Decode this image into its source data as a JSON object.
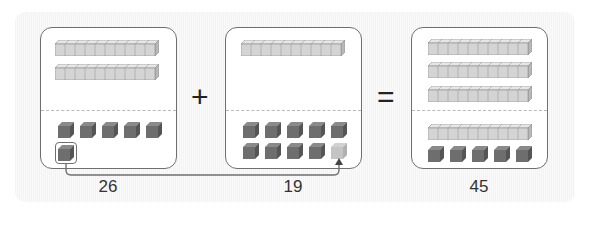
{
  "figure": {
    "type": "base-ten-blocks-addition",
    "operands": [
      {
        "label": "26",
        "tens": 2,
        "ones": 6
      },
      {
        "label": "19",
        "tens": 1,
        "ones": 9,
        "ghost_ones": 1
      }
    ],
    "operator_plus": "+",
    "operator_equals": "=",
    "result": {
      "label": "45",
      "tens": 4,
      "ones": 5
    },
    "annotation": "One unit cube moved from 26 to complete a ten in 19",
    "colors": {
      "rod_fill": "#d4d4d4",
      "rod_edge": "#8a8a8a",
      "unit_fill": "#6e6e6e",
      "unit_edge": "#4a4a4a",
      "box_border": "#6f6f6f",
      "divider": "#b9b9b9",
      "ghost_unit": "#bdbdbd"
    }
  }
}
